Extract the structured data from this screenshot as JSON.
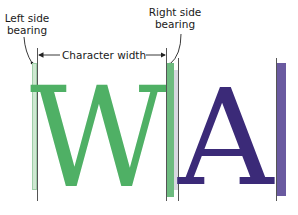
{
  "labels": {
    "left_bearing_line1": "Left side",
    "left_bearing_line2": "bearing",
    "right_bearing_line1": "Right side",
    "right_bearing_line2": "bearing",
    "character_width": "Character width"
  },
  "glyphs": {
    "first": "W",
    "second": "A"
  },
  "colors": {
    "w_glyph": "#4fb065",
    "w_bearing_left": "#cfe8d2",
    "w_bearing_right": "#6dbb7f",
    "gap_bar": "#d8d8e0",
    "a_glyph": "#3b2a78",
    "a_bearing": "#6a5aa0",
    "guide_line": "#555555"
  }
}
